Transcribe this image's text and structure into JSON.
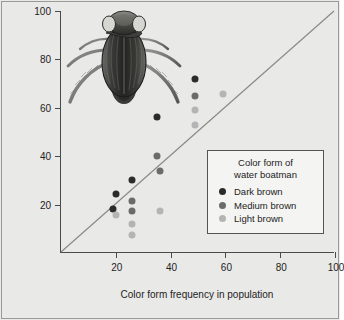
{
  "figure": {
    "background_color": "#e9e9e7",
    "illustration": {
      "name": "water-boatman-insect-illustration",
      "description": "Dorsal view engraving of a water boatman (Corixidae) aquatic insect"
    }
  },
  "chart_data": {
    "type": "scatter",
    "title": "",
    "xlabel": "Color form frequency in population",
    "ylabel": "Percent of color form taken by fish predators",
    "xlim": [
      0,
      100
    ],
    "ylim": [
      0,
      100
    ],
    "xticks": [
      20,
      40,
      60,
      80,
      100
    ],
    "yticks": [
      20,
      40,
      60,
      80,
      100
    ],
    "grid": false,
    "reference_line": {
      "name": "one-to-one-line",
      "from": [
        0,
        0
      ],
      "to": [
        100,
        100
      ],
      "color": "#8a8a86",
      "description": "1:1 diagonal line where predation equals frequency"
    },
    "legend": {
      "position": "lower-right",
      "title_line1": "Color form of",
      "title_line2": "water boatman"
    },
    "series": [
      {
        "name": "Dark brown",
        "color": "#2b2b2b",
        "points": [
          [
            19,
            18
          ],
          [
            20,
            24.5
          ],
          [
            26,
            30
          ],
          [
            35,
            56
          ],
          [
            49,
            72
          ]
        ]
      },
      {
        "name": "Medium brown",
        "color": "#6b6b6b",
        "points": [
          [
            26,
            21.5
          ],
          [
            26,
            17.5
          ],
          [
            35,
            40
          ],
          [
            36,
            34
          ],
          [
            49,
            65
          ]
        ]
      },
      {
        "name": "Light brown",
        "color": "#b4b4b4",
        "points": [
          [
            20,
            15.5
          ],
          [
            26,
            12
          ],
          [
            26,
            7.5
          ],
          [
            36,
            17.5
          ],
          [
            49,
            59
          ],
          [
            49,
            53
          ],
          [
            59,
            65.5
          ]
        ]
      }
    ]
  }
}
